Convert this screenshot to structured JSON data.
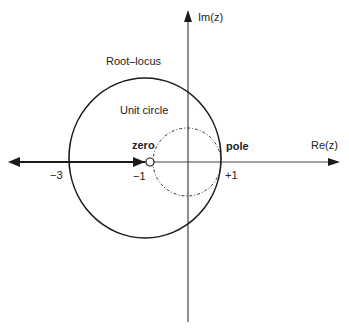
{
  "diagram": {
    "axes": {
      "x_label": "Re(z)",
      "y_label": "Im(z)"
    },
    "labels": {
      "root_locus": "Root–locus",
      "unit_circle": "Unit circle",
      "zero": "zero",
      "pole": "pole"
    },
    "ticks": {
      "minus_three": "−3",
      "minus_one": "−1",
      "plus_one": "+1"
    },
    "colors": {
      "stroke": "#1a1a1a",
      "axis": "#555555",
      "background": "#ffffff"
    }
  }
}
